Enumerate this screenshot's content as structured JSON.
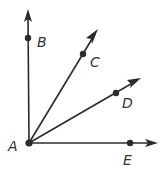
{
  "diagram": {
    "type": "rays-from-common-vertex",
    "vertex": {
      "label": "A",
      "x": 29,
      "y": 143
    },
    "rays": [
      {
        "name": "AB",
        "point_label": "B",
        "point": [
          28,
          38
        ],
        "tip": [
          28,
          10
        ]
      },
      {
        "name": "AC",
        "point_label": "C",
        "point": [
          83,
          54
        ],
        "tip": [
          98,
          29
        ]
      },
      {
        "name": "AD",
        "point_label": "D",
        "point": [
          116,
          93
        ],
        "tip": [
          141,
          78
        ]
      },
      {
        "name": "AE",
        "point_label": "E",
        "point": [
          130,
          143
        ],
        "tip": [
          158,
          143
        ]
      }
    ],
    "labels": {
      "A": "A",
      "B": "B",
      "C": "C",
      "D": "D",
      "E": "E"
    },
    "colors": {
      "stroke": "#2b2b2b",
      "label": "#333333"
    }
  }
}
